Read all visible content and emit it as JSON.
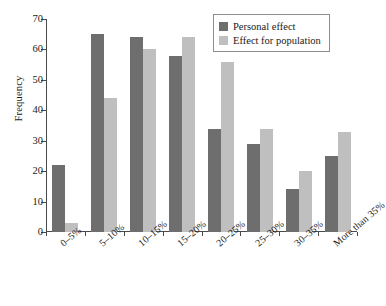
{
  "chart_data": {
    "type": "bar",
    "title": "",
    "subtitle": "",
    "xlabel": "",
    "ylabel": "Frequency",
    "categories": [
      "0–5%",
      "5–10%",
      "10–15%",
      "15–20%",
      "20–25%",
      "25–30%",
      "30–35%",
      "More than 35%"
    ],
    "series": [
      {
        "name": "Personal effect",
        "color": "#6e6e6e",
        "values": [
          22,
          65,
          64,
          58,
          34,
          29,
          14,
          25
        ]
      },
      {
        "name": "Effect for population",
        "color": "#bfbfbf",
        "values": [
          3,
          44,
          60,
          64,
          56,
          34,
          20,
          33
        ]
      }
    ],
    "ylim": [
      0,
      70
    ],
    "ytick_values": [
      0,
      10,
      20,
      30,
      40,
      50,
      60,
      70
    ],
    "ytick_labels": [
      "0",
      "10",
      "20",
      "30",
      "40",
      "50",
      "60",
      "70"
    ],
    "grid": false,
    "legend_position": "top-right",
    "legend_entries": [
      "Personal effect",
      "Effect for population"
    ],
    "annotations": []
  },
  "axes": {
    "y_title": "Frequency"
  },
  "legend": {
    "items": [
      {
        "label": "Personal effect"
      },
      {
        "label": "Effect for population"
      }
    ]
  }
}
